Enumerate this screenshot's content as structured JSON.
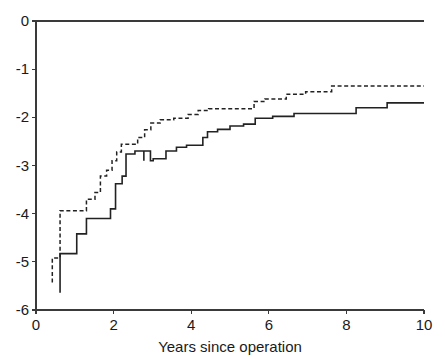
{
  "chart_data": {
    "type": "line",
    "title": "",
    "subtitle": "",
    "xlabel": "Years since operation",
    "ylabel": "",
    "xlim": [
      0,
      10
    ],
    "ylim": [
      -6,
      0
    ],
    "xticks": [
      0,
      2,
      4,
      6,
      8,
      10
    ],
    "xtick_labels": [
      "0",
      "2",
      "4",
      "6",
      "8",
      "10"
    ],
    "yticks": [
      0,
      -1,
      -2,
      -3,
      -4,
      -5,
      -6
    ],
    "ytick_labels": [
      "0",
      "-1",
      "-2",
      "-3",
      "-4",
      "-5",
      "-6"
    ],
    "grid": false,
    "legend": "none",
    "step_mode": "post",
    "annotations": [],
    "series": [
      {
        "name": "dashed-curve",
        "style": "dashed",
        "color": "#222222",
        "points": [
          [
            0.42,
            -5.43
          ],
          [
            0.42,
            -4.92
          ],
          [
            0.62,
            -4.92
          ],
          [
            0.62,
            -3.94
          ],
          [
            1.0,
            -3.94
          ],
          [
            1.3,
            -3.94
          ],
          [
            1.3,
            -3.7
          ],
          [
            1.52,
            -3.7
          ],
          [
            1.52,
            -3.56
          ],
          [
            1.66,
            -3.56
          ],
          [
            1.66,
            -3.22
          ],
          [
            1.82,
            -3.22
          ],
          [
            1.82,
            -3.1
          ],
          [
            1.96,
            -3.1
          ],
          [
            1.96,
            -2.9
          ],
          [
            2.08,
            -2.9
          ],
          [
            2.08,
            -2.72
          ],
          [
            2.2,
            -2.72
          ],
          [
            2.2,
            -2.56
          ],
          [
            2.62,
            -2.56
          ],
          [
            2.62,
            -2.42
          ],
          [
            2.8,
            -2.42
          ],
          [
            2.8,
            -2.26
          ],
          [
            2.96,
            -2.26
          ],
          [
            2.96,
            -2.12
          ],
          [
            3.2,
            -2.12
          ],
          [
            3.2,
            -2.05
          ],
          [
            3.55,
            -2.05
          ],
          [
            3.55,
            -2.02
          ],
          [
            3.92,
            -2.02
          ],
          [
            3.92,
            -1.94
          ],
          [
            4.18,
            -1.94
          ],
          [
            4.18,
            -1.86
          ],
          [
            4.45,
            -1.86
          ],
          [
            4.45,
            -1.82
          ],
          [
            5.62,
            -1.82
          ],
          [
            5.62,
            -1.67
          ],
          [
            5.9,
            -1.67
          ],
          [
            5.9,
            -1.62
          ],
          [
            6.45,
            -1.62
          ],
          [
            6.45,
            -1.52
          ],
          [
            6.95,
            -1.52
          ],
          [
            6.95,
            -1.47
          ],
          [
            7.62,
            -1.47
          ],
          [
            7.62,
            -1.35
          ],
          [
            10.0,
            -1.35
          ]
        ]
      },
      {
        "name": "solid-curve",
        "style": "solid",
        "color": "#222222",
        "points": [
          [
            0.62,
            -5.64
          ],
          [
            0.62,
            -4.83
          ],
          [
            1.05,
            -4.83
          ],
          [
            1.05,
            -4.42
          ],
          [
            1.3,
            -4.42
          ],
          [
            1.3,
            -4.1
          ],
          [
            1.92,
            -4.1
          ],
          [
            1.92,
            -3.9
          ],
          [
            2.05,
            -3.9
          ],
          [
            2.05,
            -3.38
          ],
          [
            2.22,
            -3.38
          ],
          [
            2.22,
            -3.22
          ],
          [
            2.32,
            -3.22
          ],
          [
            2.32,
            -2.76
          ],
          [
            2.55,
            -2.76
          ],
          [
            2.55,
            -2.7
          ],
          [
            2.78,
            -2.7
          ],
          [
            2.78,
            -2.9
          ],
          [
            2.78,
            -2.7
          ],
          [
            2.95,
            -2.7
          ],
          [
            2.95,
            -2.9
          ],
          [
            3.02,
            -2.9
          ],
          [
            3.02,
            -2.86
          ],
          [
            3.35,
            -2.86
          ],
          [
            3.35,
            -2.7
          ],
          [
            3.62,
            -2.7
          ],
          [
            3.62,
            -2.62
          ],
          [
            3.88,
            -2.62
          ],
          [
            3.88,
            -2.58
          ],
          [
            4.3,
            -2.58
          ],
          [
            4.3,
            -2.42
          ],
          [
            4.42,
            -2.42
          ],
          [
            4.42,
            -2.3
          ],
          [
            4.68,
            -2.3
          ],
          [
            4.68,
            -2.25
          ],
          [
            5.0,
            -2.25
          ],
          [
            5.0,
            -2.18
          ],
          [
            5.35,
            -2.18
          ],
          [
            5.35,
            -2.14
          ],
          [
            5.65,
            -2.14
          ],
          [
            5.65,
            -2.02
          ],
          [
            6.1,
            -2.02
          ],
          [
            6.1,
            -1.98
          ],
          [
            6.65,
            -1.98
          ],
          [
            6.65,
            -1.92
          ],
          [
            8.25,
            -1.92
          ],
          [
            8.25,
            -1.8
          ],
          [
            9.05,
            -1.8
          ],
          [
            9.05,
            -1.7
          ],
          [
            10.0,
            -1.7
          ]
        ]
      }
    ],
    "geometry": {
      "x0_px": 36,
      "x1_px": 424,
      "y0_px": 310,
      "y1_px": 21
    }
  }
}
